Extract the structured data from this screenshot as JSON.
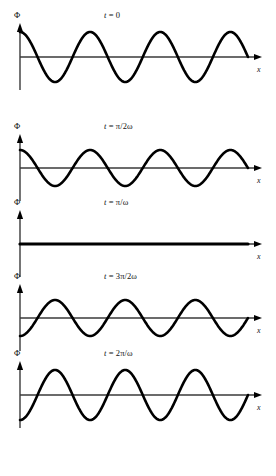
{
  "figure": {
    "width": 276,
    "height": 476,
    "background": "#ffffff",
    "ink_color": "#000000",
    "axis_color": "#3a3a3a"
  },
  "labels": {
    "y_axis_symbol": "Φ",
    "x_axis_symbol": "x"
  },
  "chart_data": {
    "type": "line",
    "title": "",
    "xlabel": "x",
    "ylabel": "Φ",
    "grid": false,
    "legend": "none",
    "x_range": [
      0,
      3.25
    ],
    "x_unit": "wavelengths",
    "y_range": [
      -1,
      1
    ],
    "n_periods": 3.25,
    "panels": [
      {
        "id": "panel-t0",
        "label": "t = 0",
        "label_parts": {
          "var": "t",
          "eq": " = ",
          "value": "0"
        },
        "amplitude": 1.0,
        "phase": "cos",
        "phase_sign": 1,
        "axis_y": 57,
        "pixel_amplitude": 25,
        "wave_stroke_width": 2.6,
        "flat": false,
        "values_at_quarter_wavelengths": [
          1,
          0,
          -1,
          0,
          1,
          0,
          -1,
          0,
          1,
          0,
          -1,
          0,
          1,
          1
        ]
      },
      {
        "id": "panel-tpi2w",
        "label": "t = π/2ω",
        "label_parts": {
          "var": "t",
          "eq": " = ",
          "value": "π/2ω"
        },
        "amplitude": 0.7,
        "phase": "cos",
        "phase_sign": 1,
        "axis_y": 168,
        "pixel_amplitude": 18,
        "wave_stroke_width": 2.6,
        "flat": false,
        "values_at_quarter_wavelengths": [
          0.7,
          0,
          -0.7,
          0,
          0.7,
          0,
          -0.7,
          0,
          0.7,
          0,
          -0.7,
          0,
          0.7,
          0.7
        ]
      },
      {
        "id": "panel-tpiw",
        "label": "t = π/ω",
        "label_parts": {
          "var": "t",
          "eq": " = ",
          "value": "π/ω"
        },
        "amplitude": 0.0,
        "phase": "cos",
        "phase_sign": 1,
        "axis_y": 244,
        "pixel_amplitude": 0,
        "wave_stroke_width": 3.2,
        "flat": true,
        "values_at_quarter_wavelengths": [
          0,
          0,
          0,
          0,
          0,
          0,
          0,
          0,
          0,
          0,
          0,
          0,
          0,
          0
        ]
      },
      {
        "id": "panel-t3pi2w",
        "label": "t = 3π/2ω",
        "label_parts": {
          "var": "t",
          "eq": " = ",
          "value": "3π/2ω"
        },
        "amplitude": 0.7,
        "phase": "cos",
        "phase_sign": -1,
        "axis_y": 318,
        "pixel_amplitude": 18,
        "wave_stroke_width": 2.6,
        "flat": false,
        "values_at_quarter_wavelengths": [
          -0.7,
          0,
          0.7,
          0,
          -0.7,
          0,
          0.7,
          0,
          -0.7,
          0,
          0.7,
          0,
          -0.7,
          -0.7
        ]
      },
      {
        "id": "panel-t2piw",
        "label": "t = 2π/ω",
        "label_parts": {
          "var": "t",
          "eq": " = ",
          "value": "2π/ω"
        },
        "amplitude": 1.0,
        "phase": "cos",
        "phase_sign": -1,
        "axis_y": 395,
        "pixel_amplitude": 25,
        "wave_stroke_width": 2.6,
        "flat": false,
        "values_at_quarter_wavelengths": [
          -1,
          0,
          1,
          0,
          -1,
          0,
          1,
          0,
          -1,
          0,
          1,
          0,
          -1,
          -1
        ]
      }
    ]
  },
  "geometry": {
    "origin_x": 20,
    "wave_start_x": 20,
    "wave_end_x": 248,
    "x_axis_arrow_tip_x": 262,
    "y_axis_arrow_tip_offset": 34,
    "y_axis_bottom_offset": 33,
    "x_label_dx": 245,
    "x_label_dy": 9,
    "y_label_dx": 14,
    "y_label_dy": -46,
    "time_label_x": 104,
    "time_label_dy": -47
  }
}
